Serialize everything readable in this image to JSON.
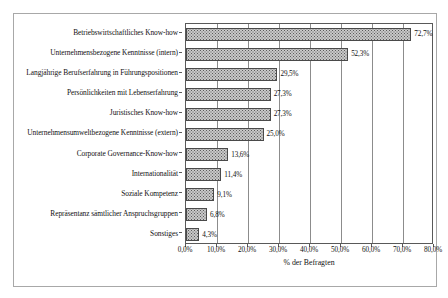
{
  "chart_data": {
    "type": "bar",
    "orientation": "horizontal",
    "title": "",
    "xlabel": "% der Befragten",
    "ylabel": "",
    "xlim": [
      0,
      80
    ],
    "xticks": [
      "0,0%",
      "10,0%",
      "20,0%",
      "30,0%",
      "40,0%",
      "50,0%",
      "60,0%",
      "70,0%",
      "80,0%"
    ],
    "xtick_values": [
      0,
      10,
      20,
      30,
      40,
      50,
      60,
      70,
      80
    ],
    "grid": true,
    "legend": null,
    "categories": [
      "Betriebswirtschaftliches Know-how",
      "Unternehmensbezogene Kenntnisse (intern)",
      "Langjährige Berufserfahrung in Führungspositionen",
      "Persönlichkeiten mit Lebenserfahrung",
      "Juristisches Know-how",
      "Unternehmensumweltbezogene Kenntnisse (extern)",
      "Corporate Governance-Know-how",
      "Internationalität",
      "Soziale Kompetenz",
      "Repräsentanz sämtlicher Anspruchsgruppen",
      "Sonstiges"
    ],
    "values": [
      72.7,
      52.3,
      29.5,
      27.3,
      27.3,
      25.0,
      13.6,
      11.4,
      9.1,
      6.8,
      4.3
    ],
    "value_labels": [
      "72,7%",
      "52,3%",
      "29,5%",
      "27,3%",
      "27,3%",
      "25,0%",
      "13,6%",
      "11,4%",
      "9,1%",
      "6,8%",
      "4,3%"
    ],
    "colors": {
      "bar_fill": "#c9c9c9",
      "bar_border": "#4a4a4a",
      "grid": "#8c8c8c",
      "axis": "#595959",
      "frame": "#a8a8a8",
      "text": "#111111",
      "background": "#ffffff"
    }
  }
}
